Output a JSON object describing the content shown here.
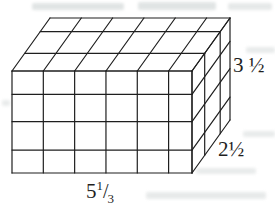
{
  "figure": {
    "type": "rectangular-prism-unit-grid",
    "dimensions": {
      "width": 5.3333,
      "height": 3.5,
      "depth": 2.5
    },
    "labels": {
      "height": "3 ½",
      "depth": "2½",
      "width_base": "5",
      "width_numerator": "1",
      "width_slash": "/",
      "width_denominator": "3"
    },
    "colors": {
      "line": "#1f1f1f",
      "background": "#ffffff",
      "text": "#1f1f1f"
    },
    "geometry": {
      "front": {
        "x": 12,
        "y": 71,
        "w": 180,
        "h": 102
      },
      "depth_vec": {
        "x": 38,
        "y": -53
      },
      "col_fracs": [
        0,
        0.174,
        0.348,
        0.522,
        0.696,
        0.87,
        1
      ],
      "row_fracs": [
        0,
        0.229,
        0.497,
        0.775,
        1
      ],
      "depth_fracs": [
        0,
        0.334,
        0.742,
        1
      ]
    }
  }
}
